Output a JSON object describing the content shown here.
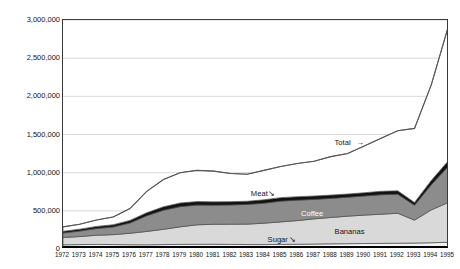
{
  "chart_data": {
    "type": "area",
    "title": "",
    "xlabel": "",
    "ylabel": "In constant US $1000",
    "x": [
      1972,
      1973,
      1974,
      1975,
      1976,
      1977,
      1978,
      1979,
      1980,
      1981,
      1982,
      1983,
      1984,
      1985,
      1986,
      1987,
      1988,
      1989,
      1990,
      1991,
      1992,
      1993,
      1994,
      1995
    ],
    "xlim": [
      1972,
      1995
    ],
    "ylim": [
      0,
      3000000
    ],
    "ytick_labels": [
      "0",
      "500,000",
      "1,000,000",
      "1,500,000",
      "2,000,000",
      "2,500,000",
      "3,000,000"
    ],
    "ytick_values": [
      0,
      500000,
      1000000,
      1500000,
      2000000,
      2500000,
      3000000
    ],
    "grid": "horizontal",
    "legend_position": "inline-annotations",
    "stacking_order_bottom_to_top": [
      "Sugar",
      "Bananas",
      "Coffee",
      "Meat",
      "Other"
    ],
    "series": [
      {
        "name": "Sugar",
        "color": "#f2f2f2",
        "values": [
          55000,
          58000,
          60000,
          58000,
          56000,
          55000,
          58000,
          60000,
          62000,
          62000,
          60000,
          58000,
          58000,
          60000,
          62000,
          65000,
          68000,
          70000,
          72000,
          74000,
          76000,
          78000,
          82000,
          88000
        ]
      },
      {
        "name": "Bananas",
        "color": "#d9d9d9",
        "values": [
          95000,
          105000,
          120000,
          130000,
          150000,
          175000,
          200000,
          230000,
          255000,
          262000,
          265000,
          268000,
          280000,
          295000,
          310000,
          330000,
          345000,
          360000,
          372000,
          382000,
          392000,
          300000,
          430000,
          520000
        ]
      },
      {
        "name": "Coffee",
        "color": "#8c8c8c",
        "values": [
          60000,
          72000,
          88000,
          100000,
          135000,
          205000,
          250000,
          265000,
          258000,
          250000,
          252000,
          258000,
          262000,
          272000,
          268000,
          255000,
          250000,
          248000,
          250000,
          255000,
          250000,
          195000,
          330000,
          470000
        ]
      },
      {
        "name": "Meat",
        "color": "#121212",
        "values": [
          22000,
          25000,
          28000,
          30000,
          34000,
          40000,
          45000,
          48000,
          46000,
          44000,
          43000,
          42000,
          44000,
          46000,
          45000,
          44000,
          43000,
          42000,
          43000,
          45000,
          44000,
          36000,
          55000,
          72000
        ]
      },
      {
        "name": "Other",
        "color": "#ffffff",
        "values": [
          58000,
          65000,
          84000,
          102000,
          155000,
          280000,
          357000,
          397000,
          409000,
          402000,
          370000,
          354000,
          386000,
          407000,
          435000,
          456000,
          504000,
          530000,
          613000,
          694000,
          788000,
          971000,
          1253000,
          1750000
        ]
      }
    ],
    "total": {
      "name": "Total",
      "color": "#555555",
      "values": [
        290000,
        325000,
        380000,
        420000,
        530000,
        755000,
        910000,
        1000000,
        1030000,
        1020000,
        990000,
        980000,
        1030000,
        1080000,
        1120000,
        1150000,
        1210000,
        1250000,
        1350000,
        1450000,
        1550000,
        1580000,
        2150000,
        2900000
      ]
    },
    "annotations": [
      {
        "label": "Total",
        "x": 1989,
        "y": 1370000,
        "arrow": "right",
        "style": "dark"
      },
      {
        "label": "Meat",
        "x": 1984,
        "y": 705000,
        "arrow": "down-right",
        "style": "dark"
      },
      {
        "label": "Coffee",
        "x": 1987,
        "y": 450000,
        "arrow": "none",
        "style": "white"
      },
      {
        "label": "Bananas",
        "x": 1989,
        "y": 215000,
        "arrow": "none",
        "style": "dark"
      },
      {
        "label": "Sugar",
        "x": 1985,
        "y": 100000,
        "arrow": "down-right",
        "style": "dark"
      }
    ]
  }
}
